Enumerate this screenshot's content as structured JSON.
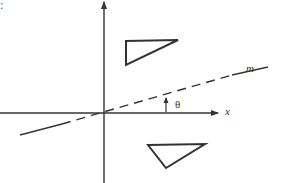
{
  "diagram": {
    "corner_text": ":",
    "labels": {
      "line": "m",
      "angle": "θ",
      "x_axis": "x"
    },
    "axes": {
      "origin": [
        104,
        113
      ],
      "x_axis": {
        "from": [
          0,
          113
        ],
        "to": [
          218,
          113
        ],
        "arrow": true
      },
      "y_axis": {
        "from": [
          104,
          183
        ],
        "to": [
          104,
          2
        ],
        "arrow": true
      }
    },
    "line_m": {
      "solid_segments": [
        [
          [
            20,
            135
          ],
          [
            62,
            124
          ]
        ],
        [
          [
            232,
            75
          ],
          [
            268,
            67
          ]
        ]
      ],
      "dashed_segment": [
        [
          62,
          124
        ],
        [
          232,
          75
        ]
      ]
    },
    "triangles": {
      "upper": [
        [
          126,
          41
        ],
        [
          178,
          40
        ],
        [
          126,
          65
        ]
      ],
      "lower": [
        [
          148,
          145
        ],
        [
          205,
          144
        ],
        [
          166,
          168
        ]
      ]
    },
    "stroke_color": "#333333"
  }
}
